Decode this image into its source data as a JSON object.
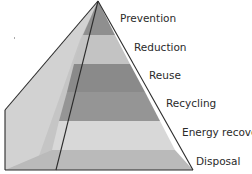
{
  "diagram": {
    "type": "pyramid",
    "title": "",
    "levels": [
      {
        "label": "Prevention",
        "color": "#8f8f8f"
      },
      {
        "label": "Reduction",
        "color": "#c3c3c3"
      },
      {
        "label": "Reuse",
        "color": "#8a8a8a"
      },
      {
        "label": "Recycling",
        "color": "#959595"
      },
      {
        "label": "Energy recovery",
        "color": "#d6d6d6"
      },
      {
        "label": "Disposal",
        "color": "#b9b9b9"
      }
    ],
    "side_face_color": "#cfcfcf",
    "outline_color": "#2b2b2b"
  }
}
